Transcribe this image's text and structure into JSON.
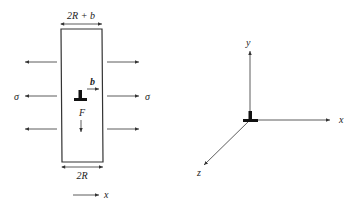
{
  "left_figure": {
    "top_width_label": "2R + b",
    "bottom_width_label": "2R",
    "stress_left_label": "σ",
    "stress_right_label": "σ",
    "burgers_vector_label": "b",
    "force_label": "F",
    "axis_label": "x",
    "dislocation_symbol": "edge-dislocation-tee"
  },
  "right_figure": {
    "y_axis_label": "y",
    "x_axis_label": "x",
    "z_axis_label": "z",
    "origin_symbol": "edge-dislocation-tee"
  },
  "colors": {
    "line": "#333333",
    "symbol": "#111111",
    "background": "#ffffff"
  }
}
